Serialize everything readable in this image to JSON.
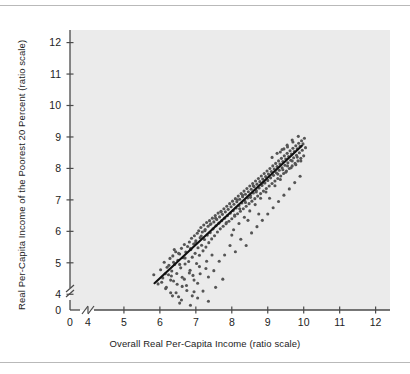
{
  "chart_data": {
    "type": "scatter",
    "title": "",
    "xlabel": "Overall Real Per-Capita Income (ratio scale)",
    "ylabel": "Real Per-Capita Income of the Poorest 20 Percent (ratio scale)",
    "xlim": [
      3.5,
      12.4
    ],
    "ylim": [
      3.5,
      12.4
    ],
    "xticks": [
      4,
      5,
      6,
      7,
      8,
      9,
      10,
      11,
      12
    ],
    "yticks": [
      4,
      5,
      6,
      7,
      8,
      9,
      10,
      11,
      12
    ],
    "xtick_labels": [
      "4",
      "5",
      "6",
      "7",
      "8",
      "9",
      "10",
      "11",
      "12"
    ],
    "ytick_labels": [
      "4",
      "5",
      "6",
      "7",
      "8",
      "9",
      "10",
      "11",
      "12"
    ],
    "origin_label": "0",
    "axis_break": true,
    "grid": false,
    "legend": null,
    "plot_background": "#ebebeb",
    "point_color": "#555555",
    "point_size": 3.1,
    "line_color": "#111111",
    "fit_line": {
      "label": "regression line",
      "x0": 5.85,
      "y0": 4.35,
      "x1": 9.95,
      "y1": 8.72
    },
    "points": [
      [
        5.83,
        4.62
      ],
      [
        5.95,
        4.33
      ],
      [
        6.02,
        4.78
      ],
      [
        6.08,
        4.52
      ],
      [
        6.12,
        5.02
      ],
      [
        6.16,
        4.18
      ],
      [
        6.2,
        4.86
      ],
      [
        6.24,
        4.62
      ],
      [
        6.28,
        5.14
      ],
      [
        6.3,
        4.05
      ],
      [
        6.33,
        4.74
      ],
      [
        6.36,
        5.22
      ],
      [
        6.38,
        4.42
      ],
      [
        6.41,
        4.95
      ],
      [
        6.44,
        5.35
      ],
      [
        6.47,
        4.66
      ],
      [
        6.5,
        5.08
      ],
      [
        6.52,
        3.92
      ],
      [
        6.55,
        5.28
      ],
      [
        6.58,
        4.84
      ],
      [
        6.6,
        5.46
      ],
      [
        6.62,
        4.54
      ],
      [
        6.65,
        5.16
      ],
      [
        6.68,
        5.58
      ],
      [
        6.7,
        4.96
      ],
      [
        6.72,
        5.34
      ],
      [
        6.74,
        4.28
      ],
      [
        6.77,
        5.52
      ],
      [
        6.8,
        5.04
      ],
      [
        6.82,
        5.66
      ],
      [
        6.84,
        4.76
      ],
      [
        6.86,
        5.42
      ],
      [
        6.88,
        5.78
      ],
      [
        6.9,
        5.18
      ],
      [
        6.92,
        4.6
      ],
      [
        6.94,
        5.6
      ],
      [
        6.96,
        5.86
      ],
      [
        6.98,
        5.3
      ],
      [
        7.0,
        5.7
      ],
      [
        7.02,
        4.98
      ],
      [
        7.04,
        5.94
      ],
      [
        7.06,
        5.48
      ],
      [
        7.08,
        6.02
      ],
      [
        7.1,
        5.24
      ],
      [
        7.12,
        5.8
      ],
      [
        7.14,
        6.12
      ],
      [
        7.16,
        5.56
      ],
      [
        7.18,
        5.98
      ],
      [
        7.2,
        5.38
      ],
      [
        7.22,
        6.2
      ],
      [
        7.24,
        5.74
      ],
      [
        7.26,
        6.06
      ],
      [
        7.28,
        5.5
      ],
      [
        7.3,
        6.28
      ],
      [
        7.32,
        5.88
      ],
      [
        7.34,
        6.16
      ],
      [
        7.36,
        5.64
      ],
      [
        7.38,
        6.34
      ],
      [
        7.4,
        5.96
      ],
      [
        7.42,
        6.24
      ],
      [
        7.44,
        5.76
      ],
      [
        7.46,
        6.42
      ],
      [
        7.48,
        6.08
      ],
      [
        7.5,
        6.3
      ],
      [
        7.52,
        5.86
      ],
      [
        7.54,
        6.5
      ],
      [
        7.56,
        6.18
      ],
      [
        7.58,
        6.38
      ],
      [
        7.6,
        5.98
      ],
      [
        7.62,
        6.58
      ],
      [
        7.64,
        6.26
      ],
      [
        7.66,
        6.46
      ],
      [
        7.68,
        6.08
      ],
      [
        7.7,
        6.64
      ],
      [
        7.72,
        6.34
      ],
      [
        7.74,
        6.54
      ],
      [
        7.76,
        6.16
      ],
      [
        7.78,
        6.72
      ],
      [
        7.8,
        6.42
      ],
      [
        7.82,
        6.62
      ],
      [
        7.84,
        6.24
      ],
      [
        7.86,
        6.8
      ],
      [
        7.88,
        6.5
      ],
      [
        7.9,
        6.7
      ],
      [
        7.92,
        6.32
      ],
      [
        7.94,
        6.88
      ],
      [
        7.96,
        6.58
      ],
      [
        7.98,
        6.78
      ],
      [
        8.0,
        6.4
      ],
      [
        8.02,
        6.96
      ],
      [
        8.04,
        6.66
      ],
      [
        8.06,
        6.86
      ],
      [
        8.08,
        6.48
      ],
      [
        8.1,
        7.04
      ],
      [
        8.12,
        6.74
      ],
      [
        8.14,
        6.94
      ],
      [
        8.16,
        6.56
      ],
      [
        8.18,
        7.12
      ],
      [
        8.2,
        6.82
      ],
      [
        8.22,
        7.02
      ],
      [
        8.24,
        6.64
      ],
      [
        8.26,
        7.2
      ],
      [
        8.28,
        6.9
      ],
      [
        8.3,
        7.1
      ],
      [
        8.32,
        6.72
      ],
      [
        8.34,
        7.28
      ],
      [
        8.36,
        6.98
      ],
      [
        8.38,
        7.18
      ],
      [
        8.4,
        6.8
      ],
      [
        8.42,
        7.36
      ],
      [
        8.44,
        7.06
      ],
      [
        8.46,
        7.26
      ],
      [
        8.48,
        6.88
      ],
      [
        8.5,
        7.44
      ],
      [
        8.52,
        7.14
      ],
      [
        8.54,
        7.34
      ],
      [
        8.56,
        6.96
      ],
      [
        8.58,
        7.52
      ],
      [
        8.6,
        7.22
      ],
      [
        8.62,
        7.42
      ],
      [
        8.64,
        7.04
      ],
      [
        8.66,
        7.6
      ],
      [
        8.68,
        7.3
      ],
      [
        8.7,
        7.5
      ],
      [
        8.72,
        7.12
      ],
      [
        8.74,
        7.68
      ],
      [
        8.76,
        7.38
      ],
      [
        8.78,
        7.58
      ],
      [
        8.8,
        7.2
      ],
      [
        8.82,
        7.76
      ],
      [
        8.84,
        7.46
      ],
      [
        8.86,
        7.66
      ],
      [
        8.88,
        7.28
      ],
      [
        8.9,
        7.84
      ],
      [
        8.92,
        7.54
      ],
      [
        8.94,
        7.74
      ],
      [
        8.96,
        7.36
      ],
      [
        8.98,
        7.92
      ],
      [
        9.0,
        7.62
      ],
      [
        9.02,
        7.82
      ],
      [
        9.04,
        7.44
      ],
      [
        9.06,
        8.0
      ],
      [
        9.08,
        7.7
      ],
      [
        9.1,
        7.9
      ],
      [
        9.12,
        7.52
      ],
      [
        9.14,
        8.08
      ],
      [
        9.16,
        7.78
      ],
      [
        9.18,
        7.98
      ],
      [
        9.2,
        7.6
      ],
      [
        9.22,
        8.16
      ],
      [
        9.24,
        7.86
      ],
      [
        9.26,
        8.06
      ],
      [
        9.28,
        7.68
      ],
      [
        9.3,
        8.24
      ],
      [
        9.32,
        7.94
      ],
      [
        9.34,
        8.14
      ],
      [
        9.36,
        7.76
      ],
      [
        9.38,
        8.32
      ],
      [
        9.4,
        8.02
      ],
      [
        9.42,
        8.22
      ],
      [
        9.44,
        7.84
      ],
      [
        9.46,
        8.4
      ],
      [
        9.48,
        8.1
      ],
      [
        9.5,
        8.3
      ],
      [
        9.52,
        7.92
      ],
      [
        9.54,
        8.48
      ],
      [
        9.56,
        8.18
      ],
      [
        9.58,
        8.38
      ],
      [
        9.6,
        8.0
      ],
      [
        9.62,
        8.56
      ],
      [
        9.64,
        8.26
      ],
      [
        9.66,
        8.46
      ],
      [
        9.68,
        8.08
      ],
      [
        9.7,
        8.64
      ],
      [
        9.72,
        8.34
      ],
      [
        9.74,
        8.54
      ],
      [
        9.76,
        8.16
      ],
      [
        9.78,
        8.72
      ],
      [
        9.8,
        8.42
      ],
      [
        9.82,
        8.62
      ],
      [
        9.84,
        8.24
      ],
      [
        9.86,
        8.8
      ],
      [
        9.88,
        8.5
      ],
      [
        9.9,
        8.7
      ],
      [
        9.92,
        8.32
      ],
      [
        9.94,
        8.88
      ],
      [
        9.96,
        8.58
      ],
      [
        9.98,
        8.78
      ],
      [
        10.0,
        8.4
      ],
      [
        10.02,
        8.96
      ],
      [
        6.45,
        4.05
      ],
      [
        6.6,
        3.82
      ],
      [
        6.75,
        4.12
      ],
      [
        6.9,
        3.95
      ],
      [
        7.05,
        4.35
      ],
      [
        7.2,
        4.1
      ],
      [
        7.35,
        4.55
      ],
      [
        6.3,
        4.45
      ],
      [
        6.15,
        4.65
      ],
      [
        7.5,
        4.75
      ],
      [
        7.65,
        5.05
      ],
      [
        7.8,
        5.25
      ],
      [
        7.95,
        5.55
      ],
      [
        8.1,
        5.35
      ],
      [
        8.25,
        5.75
      ],
      [
        8.4,
        5.55
      ],
      [
        8.55,
        5.95
      ],
      [
        8.7,
        6.15
      ],
      [
        8.85,
        6.35
      ],
      [
        9.0,
        6.55
      ],
      [
        9.15,
        6.75
      ],
      [
        9.3,
        6.95
      ],
      [
        9.45,
        7.15
      ],
      [
        9.6,
        7.35
      ],
      [
        9.75,
        7.55
      ],
      [
        9.9,
        7.75
      ],
      [
        8.05,
        6.05
      ],
      [
        8.2,
        6.25
      ],
      [
        8.35,
        6.45
      ],
      [
        8.5,
        6.65
      ],
      [
        6.85,
        5.45
      ],
      [
        7.0,
        5.65
      ],
      [
        7.15,
        5.85
      ],
      [
        7.3,
        5.05
      ],
      [
        7.45,
        5.25
      ],
      [
        6.55,
        4.95
      ],
      [
        6.7,
        5.15
      ],
      [
        8.65,
        6.85
      ],
      [
        8.8,
        7.05
      ],
      [
        8.95,
        7.25
      ],
      [
        9.55,
        8.68
      ],
      [
        9.7,
        8.84
      ],
      [
        9.85,
        9.02
      ],
      [
        9.35,
        8.52
      ],
      [
        9.45,
        8.62
      ],
      [
        10.05,
        8.66
      ],
      [
        9.92,
        8.24
      ],
      [
        9.78,
        8.12
      ],
      [
        9.65,
        8.02
      ],
      [
        9.5,
        7.88
      ],
      [
        6.38,
        5.02
      ],
      [
        6.52,
        5.3
      ],
      [
        6.68,
        4.48
      ],
      [
        6.82,
        4.68
      ],
      [
        7.1,
        4.88
      ],
      [
        7.25,
        6.02
      ],
      [
        7.4,
        6.22
      ],
      [
        7.55,
        6.42
      ],
      [
        7.7,
        6.62
      ],
      [
        7.85,
        6.28
      ],
      [
        8.0,
        5.88
      ],
      [
        8.15,
        7.0
      ],
      [
        8.3,
        7.15
      ],
      [
        8.45,
        6.35
      ],
      [
        8.6,
        7.45
      ],
      [
        8.75,
        6.55
      ],
      [
        8.9,
        7.55
      ],
      [
        9.05,
        7.05
      ],
      [
        9.2,
        7.45
      ],
      [
        9.35,
        7.65
      ],
      [
        6.25,
        4.92
      ],
      [
        6.4,
        5.42
      ],
      [
        6.95,
        4.45
      ],
      [
        7.12,
        4.65
      ],
      [
        7.28,
        4.82
      ],
      [
        9.82,
        8.36
      ],
      [
        9.68,
        8.24
      ],
      [
        9.55,
        8.08
      ],
      [
        9.42,
        7.96
      ],
      [
        9.28,
        7.82
      ],
      [
        6.05,
        4.38
      ],
      [
        6.18,
        4.22
      ],
      [
        6.32,
        4.58
      ],
      [
        6.48,
        4.32
      ],
      [
        6.62,
        4.25
      ],
      [
        8.08,
        6.52
      ],
      [
        8.22,
        6.72
      ],
      [
        8.38,
        6.92
      ],
      [
        8.52,
        7.08
      ],
      [
        8.68,
        7.25
      ],
      [
        9.12,
        8.35
      ],
      [
        9.26,
        8.48
      ],
      [
        9.4,
        8.6
      ],
      [
        9.54,
        8.74
      ],
      [
        9.68,
        8.9
      ]
    ],
    "outliers": [
      [
        6.55,
        3.72
      ],
      [
        6.85,
        3.65
      ],
      [
        7.05,
        3.88
      ],
      [
        7.35,
        3.78
      ],
      [
        6.95,
        4.08
      ],
      [
        7.55,
        4.22
      ],
      [
        7.75,
        4.48
      ],
      [
        6.35,
        3.95
      ]
    ]
  }
}
